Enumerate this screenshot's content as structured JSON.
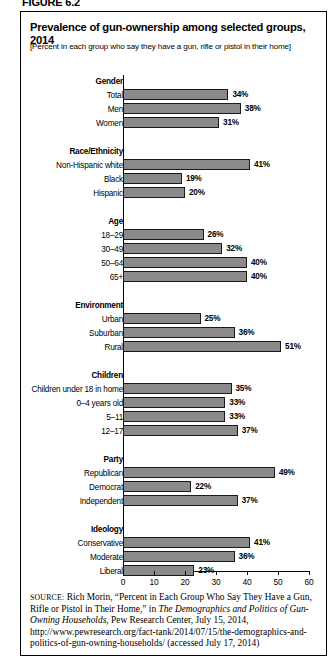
{
  "figure_label": "FIGURE 6.2",
  "title": "Prevalence of gun-ownership among selected groups, 2014",
  "subtitle": "[Percent in each group who say they have a gun, rifle or pistol in their home]",
  "chart_data": {
    "type": "bar",
    "orientation": "horizontal",
    "title": "Prevalence of gun-ownership among selected groups, 2014",
    "subtitle": "[Percent in each group who say they have a gun, rifle or pistol in their home]",
    "xlabel": "",
    "ylabel": "",
    "xlim": [
      0,
      60
    ],
    "xticks": [
      0,
      10,
      20,
      30,
      40,
      50,
      60
    ],
    "xtick_labels": [
      "0",
      "10",
      "20",
      "30",
      "40",
      "50",
      "60"
    ],
    "grid": false,
    "legend": false,
    "value_suffix": "%",
    "bar_color": "#8a8a8a",
    "bar_border_color": "#1a1a1a",
    "groups": [
      {
        "name": "Gender",
        "items": [
          {
            "label": "Total",
            "value": 34,
            "value_label": "34%"
          },
          {
            "label": "Men",
            "value": 38,
            "value_label": "38%"
          },
          {
            "label": "Women",
            "value": 31,
            "value_label": "31%"
          }
        ]
      },
      {
        "name": "Race/Ethnicity",
        "items": [
          {
            "label": "Non-Hispanic white",
            "value": 41,
            "value_label": "41%"
          },
          {
            "label": "Black",
            "value": 19,
            "value_label": "19%"
          },
          {
            "label": "Hispanic",
            "value": 20,
            "value_label": "20%"
          }
        ]
      },
      {
        "name": "Age",
        "items": [
          {
            "label": "18–29",
            "value": 26,
            "value_label": "26%"
          },
          {
            "label": "30–49",
            "value": 32,
            "value_label": "32%"
          },
          {
            "label": "50–64",
            "value": 40,
            "value_label": "40%"
          },
          {
            "label": "65+",
            "value": 40,
            "value_label": "40%"
          }
        ]
      },
      {
        "name": "Environment",
        "items": [
          {
            "label": "Urban",
            "value": 25,
            "value_label": "25%"
          },
          {
            "label": "Suburban",
            "value": 36,
            "value_label": "36%"
          },
          {
            "label": "Rural",
            "value": 51,
            "value_label": "51%"
          }
        ]
      },
      {
        "name": "Children",
        "items": [
          {
            "label": "Children under 18 in home",
            "value": 35,
            "value_label": "35%"
          },
          {
            "label": "0–4 years old",
            "value": 33,
            "value_label": "33%"
          },
          {
            "label": "5–11",
            "value": 33,
            "value_label": "33%"
          },
          {
            "label": "12–17",
            "value": 37,
            "value_label": "37%"
          }
        ]
      },
      {
        "name": "Party",
        "items": [
          {
            "label": "Republican",
            "value": 49,
            "value_label": "49%"
          },
          {
            "label": "Democrat",
            "value": 22,
            "value_label": "22%"
          },
          {
            "label": "Independent",
            "value": 37,
            "value_label": "37%"
          }
        ]
      },
      {
        "name": "Ideology",
        "items": [
          {
            "label": "Conservative",
            "value": 41,
            "value_label": "41%"
          },
          {
            "label": "Moderate",
            "value": 36,
            "value_label": "36%"
          },
          {
            "label": "Liberal",
            "value": 23,
            "value_label": "23%"
          }
        ]
      }
    ]
  },
  "source": {
    "prefix": "SOURCE:",
    "segments": [
      {
        "text": " Rich Morin, “Percent in Each Group Who Say They Have a Gun, Rifle or Pistol in Their Home,” in ",
        "italic": false
      },
      {
        "text": "The Demographics and Politics of Gun-Owning Households",
        "italic": true
      },
      {
        "text": ", Pew Research Center, July 15, 2014, http://www.pewresearch.org/fact-tank/2014/07/15/the-demographics-and-politics-of-gun-owning-households/ (accessed July 17, 2014)",
        "italic": false
      }
    ]
  }
}
